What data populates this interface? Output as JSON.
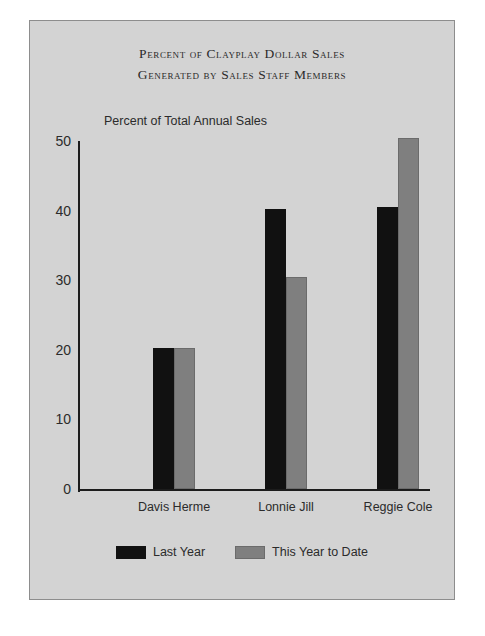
{
  "chart_data": {
    "type": "bar",
    "title": "Percent of Clayplay Dollar Sales",
    "subtitle": "Generated by Sales Staff Members",
    "xlabel": "",
    "ylabel": "Percent of Total Annual Sales",
    "categories": [
      "Davis Herme",
      "Lonnie Jill",
      "Reggie Cole"
    ],
    "series": [
      {
        "name": "Last Year",
        "color": "#111111",
        "values": [
          20.3,
          40.3,
          40.5
        ]
      },
      {
        "name": "This Year to Date",
        "color": "#7f7f7f",
        "values": [
          20.3,
          30.4,
          50.5
        ]
      }
    ],
    "ylim": [
      0,
      50
    ],
    "yticks": [
      "0",
      "10",
      "20",
      "30",
      "40",
      "50"
    ],
    "grid": false,
    "legend_position": "bottom"
  },
  "figure": {
    "background_color": "#d3d3d3",
    "border_color": "#8d8d8d"
  }
}
